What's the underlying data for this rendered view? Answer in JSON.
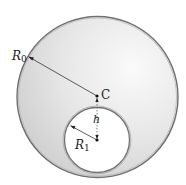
{
  "diagram": {
    "outer_circle": {
      "radius_label": "R",
      "radius_sub": "0"
    },
    "inner_circle": {
      "radius_label": "R",
      "radius_sub": "1"
    },
    "center_label": "C",
    "offset_label": "h",
    "colors": {
      "outer_fill": "#dedede",
      "outer_highlight": "#f6f6f6",
      "stroke": "#6a6a6a",
      "inner_fill": "#ffffff",
      "ink": "#222222"
    }
  }
}
